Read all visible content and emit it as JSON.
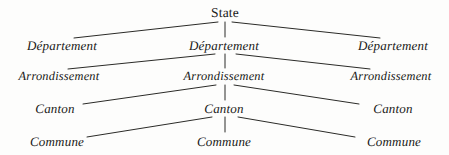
{
  "diagram": {
    "background_color": "#fdfdfc",
    "line_color": "#2b2b28",
    "text_color": "#181816",
    "levels": [
      {
        "id": "state",
        "name": "State",
        "nodes": [
          {
            "label": "State",
            "x": 225,
            "y": 13,
            "style": "upright"
          }
        ]
      },
      {
        "id": "departement",
        "name": "Département",
        "nodes": [
          {
            "label": "Département",
            "x": 62,
            "y": 45,
            "style": "italic"
          },
          {
            "label": "Département",
            "x": 224,
            "y": 45,
            "style": "italic"
          },
          {
            "label": "Département",
            "x": 393,
            "y": 45,
            "style": "italic"
          }
        ]
      },
      {
        "id": "arrondissement",
        "name": "Arrondissement",
        "nodes": [
          {
            "label": "Arrondissement",
            "x": 59,
            "y": 76,
            "style": "italic"
          },
          {
            "label": "Arrondissement",
            "x": 224,
            "y": 76,
            "style": "italic"
          },
          {
            "label": "Arrondissement",
            "x": 391,
            "y": 76,
            "style": "italic"
          }
        ]
      },
      {
        "id": "canton",
        "name": "Canton",
        "nodes": [
          {
            "label": "Canton",
            "x": 55,
            "y": 108,
            "style": "italic"
          },
          {
            "label": "Canton",
            "x": 224,
            "y": 108,
            "style": "italic"
          },
          {
            "label": "Canton",
            "x": 393,
            "y": 108,
            "style": "italic"
          }
        ]
      },
      {
        "id": "commune",
        "name": "Commune",
        "nodes": [
          {
            "label": "Commune",
            "x": 57,
            "y": 141,
            "style": "italic"
          },
          {
            "label": "Commune",
            "x": 224,
            "y": 141,
            "style": "italic"
          },
          {
            "label": "Commune",
            "x": 394,
            "y": 141,
            "style": "italic"
          }
        ]
      }
    ],
    "edges": [
      {
        "from": "state",
        "to": "departement-left",
        "x1": 218,
        "y1": 22,
        "x2": 74,
        "y2": 38
      },
      {
        "from": "state",
        "to": "departement-center",
        "x1": 225,
        "y1": 22,
        "x2": 225,
        "y2": 37
      },
      {
        "from": "state",
        "to": "departement-right",
        "x1": 232,
        "y1": 22,
        "x2": 380,
        "y2": 38
      },
      {
        "from": "departement",
        "to": "arrondissement-left",
        "x1": 215,
        "y1": 54,
        "x2": 68,
        "y2": 69
      },
      {
        "from": "departement",
        "to": "arrondissement-center",
        "x1": 225,
        "y1": 54,
        "x2": 225,
        "y2": 68
      },
      {
        "from": "departement",
        "to": "arrondissement-right",
        "x1": 236,
        "y1": 54,
        "x2": 370,
        "y2": 69
      },
      {
        "from": "arrondissement",
        "to": "canton-left",
        "x1": 216,
        "y1": 85,
        "x2": 83,
        "y2": 104
      },
      {
        "from": "arrondissement",
        "to": "canton-center",
        "x1": 225,
        "y1": 85,
        "x2": 225,
        "y2": 100
      },
      {
        "from": "arrondissement",
        "to": "canton-right",
        "x1": 234,
        "y1": 85,
        "x2": 359,
        "y2": 104
      },
      {
        "from": "canton",
        "to": "commune-left",
        "x1": 212,
        "y1": 117,
        "x2": 87,
        "y2": 137
      },
      {
        "from": "canton",
        "to": "commune-center",
        "x1": 225,
        "y1": 117,
        "x2": 225,
        "y2": 132
      },
      {
        "from": "canton",
        "to": "commune-right",
        "x1": 238,
        "y1": 117,
        "x2": 355,
        "y2": 137
      }
    ]
  }
}
